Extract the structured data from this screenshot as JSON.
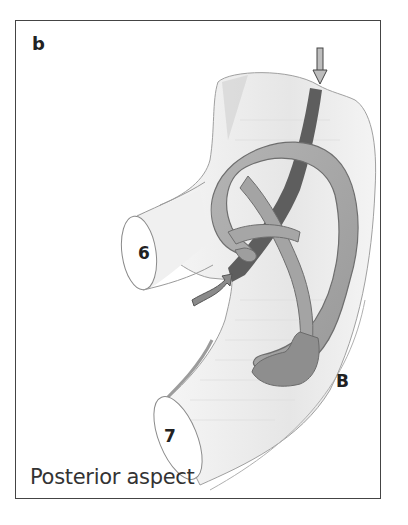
{
  "figure": {
    "panel_letter": "b",
    "caption": "Posterior aspect",
    "labels": {
      "segment_6": "6",
      "segment_7": "7",
      "region_b": "B"
    },
    "arrows": [
      {
        "name": "down-arrow",
        "direction": "down"
      },
      {
        "name": "curved-arrow",
        "direction": "up-right"
      }
    ],
    "colors": {
      "frame": "#444444",
      "duct_fill": "#a8a8a8",
      "duct_stroke": "#6e6e6e",
      "tube_fill": "#ececec",
      "tube_stroke": "#9a9a9a",
      "band": "#5a5a5a",
      "text": "#222222"
    }
  }
}
